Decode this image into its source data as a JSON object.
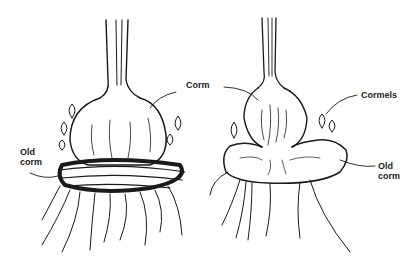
{
  "diagram": {
    "left_figure": {
      "labels": [
        {
          "id": "old-corm-left",
          "lines": [
            "Old",
            "corm"
          ]
        },
        {
          "id": "corm",
          "lines": [
            "Corm"
          ]
        }
      ]
    },
    "right_figure": {
      "labels": [
        {
          "id": "cormels",
          "lines": [
            "Cormels"
          ]
        },
        {
          "id": "old-corm-right",
          "lines": [
            "Old",
            "corm"
          ]
        }
      ]
    },
    "colors": {
      "ink": "#1a1a1a",
      "background": "#ffffff"
    }
  }
}
